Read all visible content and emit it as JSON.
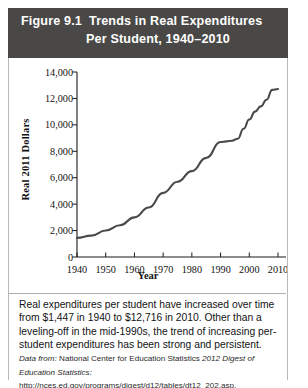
{
  "figure": {
    "label": "Figure 9.1",
    "title_line1": "Trends in Real Expenditures",
    "title_line2": "Per Student, 1940–2010",
    "header_color": "#4a4846"
  },
  "caption": {
    "body": "Real expenditures per student have increased over time from $1,447 in 1940 to $12,716 in 2010. Other than a leveling-off in the mid-1990s, the trend of increasing per-student expenditures has been strong and persistent.",
    "source_prefix": "Data from:",
    "source_org": "National Center for Education Statistics",
    "source_title": "2012 Digest of Education Statistics:",
    "source_url": "http://nces.ed.gov/programs/digest/d12/tables/dt12_202.asp."
  },
  "chart_data": {
    "type": "line",
    "title": "Trends in Real Expenditures Per Student, 1940–2010",
    "xlabel": "Year",
    "ylabel": "Real 2011 Dollars",
    "xlim": [
      1940,
      2010
    ],
    "ylim": [
      0,
      14000
    ],
    "grid": false,
    "legend": false,
    "line_color": "#4a4a4a",
    "xticks": [
      1940,
      1950,
      1960,
      1970,
      1980,
      1990,
      2000,
      2010
    ],
    "xtick_labels": [
      "1940",
      "1950",
      "1960",
      "1970",
      "1980",
      "1990",
      "2000",
      "2010"
    ],
    "yticks": [
      0,
      2000,
      4000,
      6000,
      8000,
      10000,
      12000,
      14000
    ],
    "ytick_labels": [
      "0",
      "2,000",
      "4,000",
      "6,000",
      "8,000",
      "10,000",
      "12,000",
      "14,000"
    ],
    "series": [
      {
        "name": "Real expenditures per student",
        "x": [
          1940,
          1945,
          1950,
          1955,
          1960,
          1965,
          1970,
          1975,
          1980,
          1985,
          1990,
          1992,
          1994,
          1996,
          1998,
          2000,
          2002,
          2004,
          2006,
          2008,
          2010
        ],
        "values": [
          1447,
          1620,
          2000,
          2400,
          3000,
          3750,
          4850,
          5700,
          6500,
          7500,
          8700,
          8750,
          8800,
          8950,
          9700,
          10400,
          11000,
          11400,
          11900,
          12650,
          12716
        ]
      }
    ],
    "annotations": [
      {
        "year": 1940,
        "value": 1447,
        "text": "$1,447 in 1940"
      },
      {
        "year": 2010,
        "value": 12716,
        "text": "$12,716 in 2010"
      }
    ]
  }
}
